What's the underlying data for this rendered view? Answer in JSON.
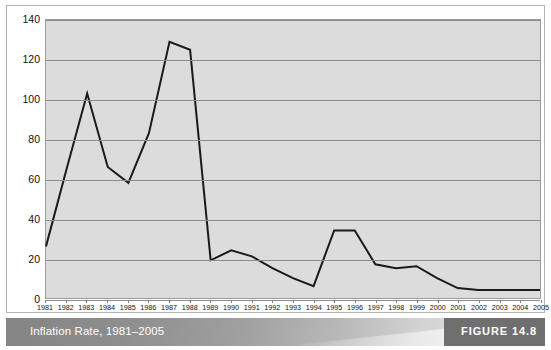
{
  "caption": {
    "title": "Inflation Rate, 1981–2005",
    "figure_label": "FIGURE 14.8"
  },
  "colors": {
    "plot_background": "#dcdcdc",
    "gridline": "#8c8c8c",
    "line": "#1a1a1a",
    "plot_border": "#9a9a9a",
    "frame_border": "#b4b4b4",
    "caption_text": "#ffffff",
    "badge_background": "#6f6f6f",
    "page_background": "#ffffff"
  },
  "chart_data": {
    "type": "line",
    "title": "Inflation Rate, 1981–2005",
    "xlabel": "",
    "ylabel": "",
    "ylim": [
      0,
      140
    ],
    "yticks": [
      0,
      20,
      40,
      60,
      80,
      100,
      120,
      140
    ],
    "grid": true,
    "legend": null,
    "categories": [
      "1981",
      "1982",
      "1983",
      "1984",
      "1985",
      "1986",
      "1987",
      "1988",
      "1989",
      "1990",
      "1991",
      "1992",
      "1993",
      "1994",
      "1995",
      "1996",
      "1997",
      "1998",
      "1999",
      "2000",
      "2001",
      "2002",
      "2003",
      "2004",
      "2005"
    ],
    "values": [
      26,
      65,
      103,
      66,
      58,
      83,
      129,
      125,
      19,
      24,
      21,
      15,
      10,
      6,
      34,
      34,
      17,
      15,
      16,
      10,
      5,
      4,
      4,
      4,
      4
    ]
  }
}
